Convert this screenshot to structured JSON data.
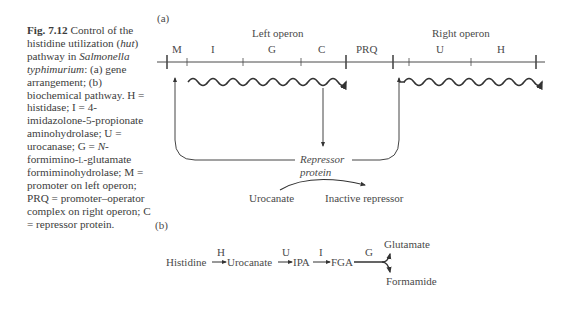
{
  "caption": {
    "figure_number": "Fig. 7.12",
    "text_1": " Control of the histidine utilization (",
    "hut": "hut",
    "text_2": ") pathway in ",
    "organism": "Salmonella typhimurium",
    "text_3": ": (a) gene arrangement; (b) biochemical pathway. H = histidase; I = 4-imidazolone-5-propionate aminohydrolase; U = urocanase; G = ",
    "n_italic": "N",
    "text_4": "-formimino-",
    "l_small": "l",
    "text_5": "-glutamate formiminohydrolase; M = promoter on left operon; PRQ = promoter–operator complex on right operon; C = repressor protein."
  },
  "panel_a": {
    "label": "(a)",
    "left_operon_label": "Left operon",
    "right_operon_label": "Right operon",
    "genes": [
      "M",
      "I",
      "G",
      "C",
      "PRQ",
      "U",
      "H"
    ],
    "repressor_label_line1": "Repressor",
    "repressor_label_line2": "protein",
    "inducer": "Urocanate",
    "inactive": "Inactive repressor"
  },
  "panel_b": {
    "label": "(b)",
    "substrates": [
      "Histidine",
      "Urocanate",
      "IPA",
      "FGA"
    ],
    "enzymes": [
      "H",
      "U",
      "I",
      "G"
    ],
    "products": [
      "Glutamate",
      "Formamide"
    ]
  },
  "colors": {
    "line": "#4a4a4a",
    "text": "#3c3c3c"
  }
}
